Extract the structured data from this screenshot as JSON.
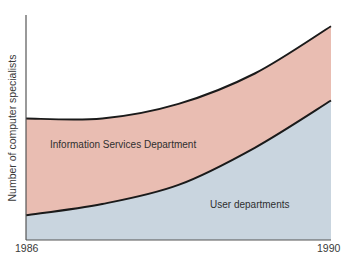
{
  "chart_data": {
    "type": "area",
    "stacked": true,
    "title": "",
    "xlabel": "",
    "ylabel": "Number of computer specialists",
    "x": [
      1986,
      1987,
      1988,
      1989,
      1990
    ],
    "x_tick_labels": [
      "1986",
      "1990"
    ],
    "xlim": [
      1986,
      1990
    ],
    "ylim": [
      0,
      100
    ],
    "y_ticks_shown": false,
    "grid": false,
    "legend": "inline labels inside areas",
    "series": [
      {
        "name": "User departments",
        "values": [
          11,
          16,
          24.5,
          41,
          62
        ],
        "color": "#C9D5DF"
      },
      {
        "name": "Information Services Department",
        "values": [
          43,
          38,
          36,
          33,
          33
        ],
        "color": "#E9BDB2"
      }
    ],
    "cumulative_total": [
      54,
      54,
      60.5,
      74,
      95
    ]
  },
  "labels": {
    "y_axis": "Number of computer specialists",
    "x_start": "1986",
    "x_end": "1990",
    "information_services": "Information Services Department",
    "user_departments": "User departments"
  },
  "colors": {
    "information_services": "#E9BDB2",
    "user_departments": "#C9D5DF",
    "curve_stroke": "#1a1a1a",
    "axis": "#555555"
  }
}
